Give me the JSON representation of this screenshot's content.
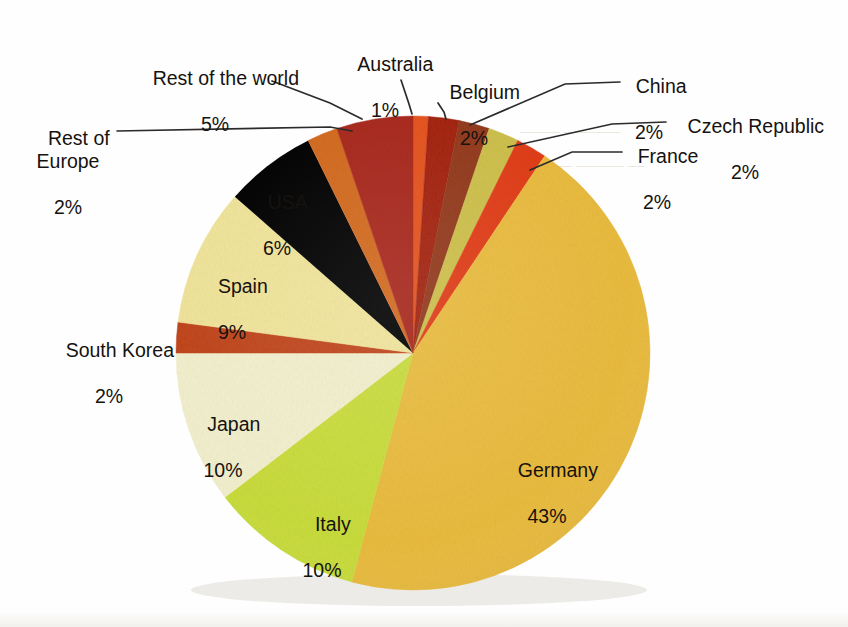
{
  "chart_data": {
    "type": "pie",
    "title": "",
    "subtitle": "",
    "xlabel": "",
    "ylabel": "",
    "legend_position": "none",
    "grid": false,
    "units": "percent",
    "total": 100,
    "label_format": "{name}\n{value}%",
    "start_angle_deg": 0,
    "direction": "clockwise",
    "categories": [
      "Australia",
      "Belgium",
      "China",
      "Czech Republic",
      "France",
      "Germany",
      "Italy",
      "Japan",
      "South Korea",
      "Spain",
      "USA",
      "Rest of Europe",
      "Rest of the world"
    ],
    "values": [
      1,
      2,
      2,
      2,
      2,
      43,
      10,
      10,
      2,
      9,
      6,
      2,
      5
    ],
    "slices": [
      {
        "name": "Australia",
        "value": 1,
        "display": "1%",
        "color": "#e4521c",
        "label_placement": "outside",
        "leader": true
      },
      {
        "name": "Belgium",
        "value": 2,
        "display": "2%",
        "color": "#a3200f",
        "label_placement": "outside",
        "leader": true
      },
      {
        "name": "China",
        "value": 2,
        "display": "2%",
        "color": "#92381a",
        "label_placement": "outside",
        "leader": true
      },
      {
        "name": "Czech Republic",
        "value": 2,
        "display": "2%",
        "color": "#cdbf4a",
        "label_placement": "outside",
        "leader": true
      },
      {
        "name": "France",
        "value": 2,
        "display": "2%",
        "color": "#e03c16",
        "label_placement": "outside",
        "leader": true
      },
      {
        "name": "Germany",
        "value": 43,
        "display": "43%",
        "color": "#e9bb3f",
        "label_placement": "inside",
        "leader": false
      },
      {
        "name": "Italy",
        "value": 10,
        "display": "10%",
        "color": "#c8dc3c",
        "label_placement": "inside",
        "leader": false
      },
      {
        "name": "Japan",
        "value": 10,
        "display": "10%",
        "color": "#f2efcd",
        "label_placement": "inside",
        "leader": false
      },
      {
        "name": "South Korea",
        "value": 2,
        "display": "2%",
        "color": "#c0451a",
        "label_placement": "outside",
        "leader": false
      },
      {
        "name": "Spain",
        "value": 9,
        "display": "9%",
        "color": "#f0e49a",
        "label_placement": "inside",
        "leader": false
      },
      {
        "name": "USA",
        "value": 6,
        "display": "6%",
        "color": "#edc githubc",
        "label_placement": "inside",
        "leader": false
      },
      {
        "name": "Rest of Europe",
        "value": 2,
        "display": "2%",
        "color": "#d2691e",
        "label_placement": "outside",
        "leader": true
      },
      {
        "name": "Rest of the world",
        "value": 5,
        "display": "5%",
        "color": "#a8281a",
        "label_placement": "outside",
        "leader": true
      }
    ]
  },
  "labels": {
    "rest_of_europe": {
      "name": "Rest of\nEurope",
      "pct": "2%"
    },
    "rest_of_the_world": {
      "name": "Rest of the world",
      "pct": "5%"
    },
    "australia": {
      "name": "Australia",
      "pct": "1%"
    },
    "belgium": {
      "name": "Belgium",
      "pct": "2%"
    },
    "china": {
      "name": "China",
      "pct": "2%"
    },
    "czech_republic": {
      "name": "Czech Republic",
      "pct": "2%"
    },
    "france": {
      "name": "France",
      "pct": "2%"
    },
    "usa": {
      "name": "USA",
      "pct": "6%"
    },
    "spain": {
      "name": "Spain",
      "pct": "9%"
    },
    "south_korea": {
      "name": "South Korea",
      "pct": "2%"
    },
    "japan": {
      "name": "Japan",
      "pct": "10%"
    },
    "italy": {
      "name": "Italy",
      "pct": "10%"
    },
    "germany": {
      "name": "Germany",
      "pct": "43%"
    }
  },
  "geometry": {
    "center_x": 413,
    "center_y": 353,
    "radius": 237
  },
  "colors": {
    "background": "#fefefe",
    "text": "#16120f",
    "leader_line": "#2b2b2b"
  }
}
